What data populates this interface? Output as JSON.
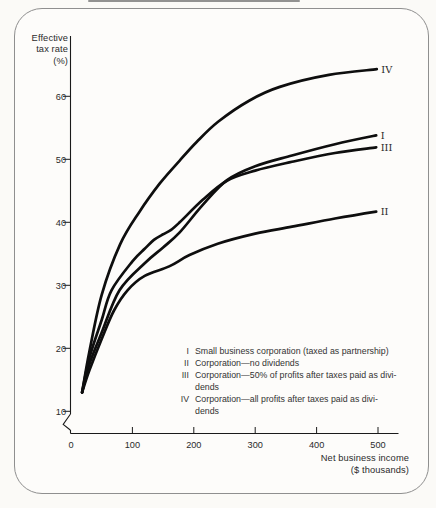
{
  "figure": {
    "y_axis_title_lines": [
      "Effective",
      "tax rate",
      "(%)"
    ],
    "x_axis_title_lines": [
      "Net business income",
      "($ thousands)"
    ]
  },
  "legend": {
    "items": [
      {
        "numeral": "I",
        "lines": [
          "Small business corporation (taxed as partnership)"
        ]
      },
      {
        "numeral": "II",
        "lines": [
          "Corporation—no dividends"
        ]
      },
      {
        "numeral": "III",
        "lines": [
          "Corporation—50% of profits after taxes paid as divi-",
          "dends"
        ]
      },
      {
        "numeral": "IV",
        "lines": [
          "Corporation—all profits after taxes paid as divi-",
          "dends"
        ]
      }
    ]
  },
  "chart_data": {
    "type": "line",
    "title": "",
    "xlabel": "Net business income ($ thousands)",
    "ylabel": "Effective tax rate (%)",
    "x_ticks": [
      0,
      100,
      200,
      300,
      400,
      500
    ],
    "y_ticks": [
      10,
      20,
      30,
      40,
      50,
      60
    ],
    "xlim": [
      0,
      535
    ],
    "ylim_shown": [
      10,
      66
    ],
    "axis_break_below_y": 10,
    "grid": false,
    "line_color": "#0e0e0e",
    "axis_color": "#1a1a1a",
    "tick_label_color": "#2b2b2b",
    "series": [
      {
        "name": "I",
        "description": "Small business corporation (taxed as partnership)",
        "points": [
          [
            18,
            13
          ],
          [
            30,
            17.5
          ],
          [
            50,
            22.5
          ],
          [
            79,
            29.2
          ],
          [
            120,
            33.5
          ],
          [
            150,
            36
          ],
          [
            177,
            38.4
          ],
          [
            215,
            42.8
          ],
          [
            254,
            46.7
          ],
          [
            300,
            48.9
          ],
          [
            360,
            50.6
          ],
          [
            430,
            52.4
          ],
          [
            497,
            53.8
          ]
        ]
      },
      {
        "name": "II",
        "description": "Corporation—no dividends",
        "points": [
          [
            18,
            13
          ],
          [
            30,
            16.5
          ],
          [
            50,
            21.5
          ],
          [
            70,
            26
          ],
          [
            92,
            29.2
          ],
          [
            120,
            31.5
          ],
          [
            160,
            33.0
          ],
          [
            193,
            34.8
          ],
          [
            239,
            36.6
          ],
          [
            300,
            38.2
          ],
          [
            360,
            39.3
          ],
          [
            430,
            40.6
          ],
          [
            497,
            41.7
          ]
        ]
      },
      {
        "name": "III",
        "description": "Corporation—50% of profits after taxes paid as dividends",
        "points": [
          [
            18,
            13
          ],
          [
            30,
            18.5
          ],
          [
            50,
            24.5
          ],
          [
            66,
            29.2
          ],
          [
            100,
            33.8
          ],
          [
            120,
            35.8
          ],
          [
            135,
            37.2
          ],
          [
            150,
            38.1
          ],
          [
            163,
            38.8
          ],
          [
            177,
            40
          ],
          [
            215,
            43.6
          ],
          [
            254,
            46.6
          ],
          [
            300,
            48.2
          ],
          [
            360,
            49.6
          ],
          [
            430,
            51
          ],
          [
            497,
            51.9
          ]
        ]
      },
      {
        "name": "IV",
        "description": "Corporation—all profits after taxes paid as dividends",
        "points": [
          [
            18,
            13
          ],
          [
            30,
            19.5
          ],
          [
            50,
            28.5
          ],
          [
            80,
            36.5
          ],
          [
            111,
            41.6
          ],
          [
            145,
            46.2
          ],
          [
            177,
            49.8
          ],
          [
            205,
            52.8
          ],
          [
            240,
            56
          ],
          [
            290,
            59.3
          ],
          [
            340,
            61.5
          ],
          [
            420,
            63.4
          ],
          [
            498,
            64.3
          ]
        ]
      }
    ]
  }
}
